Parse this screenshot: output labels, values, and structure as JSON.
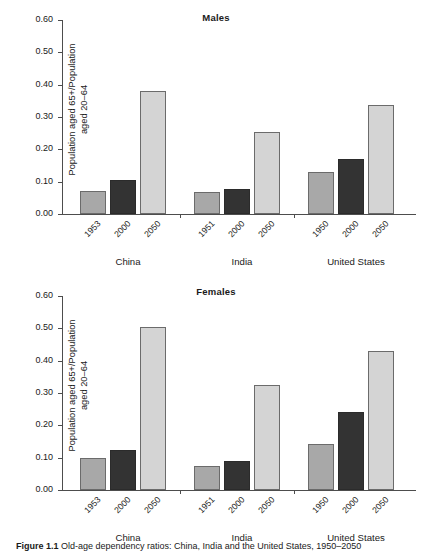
{
  "figure": {
    "caption_label": "Figure 1.1",
    "caption_text": "Old-age dependency ratios: China, India and the United States, 1950–2050"
  },
  "axis": {
    "ylabel_line1": "Population aged 65+/Population",
    "ylabel_line2": "aged 20–64",
    "yticks": [
      "0.00",
      "0.10",
      "0.20",
      "0.30",
      "0.40",
      "0.50",
      "0.60"
    ]
  },
  "chart_data": [
    {
      "type": "bar",
      "title": "Males",
      "xlabel": "",
      "ylabel": "Population aged 65+/Population aged 20–64",
      "ylim": [
        0.0,
        0.6
      ],
      "ytick_step": 0.1,
      "grid": false,
      "legend": "none",
      "groups": [
        {
          "name": "China",
          "categories": [
            "1953",
            "2000",
            "2050"
          ],
          "values": [
            0.071,
            0.104,
            0.382
          ]
        },
        {
          "name": "India",
          "categories": [
            "1951",
            "2000",
            "2050"
          ],
          "values": [
            0.067,
            0.077,
            0.253
          ]
        },
        {
          "name": "United States",
          "categories": [
            "1950",
            "2000",
            "2050"
          ],
          "values": [
            0.13,
            0.171,
            0.336
          ]
        }
      ]
    },
    {
      "type": "bar",
      "title": "Females",
      "xlabel": "",
      "ylabel": "Population aged 65+/Population aged 20–64",
      "ylim": [
        0.0,
        0.6
      ],
      "ytick_step": 0.1,
      "grid": false,
      "legend": "none",
      "groups": [
        {
          "name": "China",
          "categories": [
            "1953",
            "2000",
            "2050"
          ],
          "values": [
            0.1,
            0.125,
            0.503
          ]
        },
        {
          "name": "India",
          "categories": [
            "1951",
            "2000",
            "2050"
          ],
          "values": [
            0.074,
            0.089,
            0.326
          ]
        },
        {
          "name": "United States",
          "categories": [
            "1950",
            "2000",
            "2050"
          ],
          "values": [
            0.143,
            0.241,
            0.429
          ]
        }
      ]
    }
  ],
  "colors": {
    "series_0": "#a8a8a8",
    "series_1": "#333333",
    "series_2": "#d4d4d4",
    "axis": "#4d4d4d",
    "text": "#1a1a1a",
    "background": "#ffffff"
  }
}
